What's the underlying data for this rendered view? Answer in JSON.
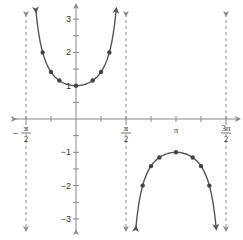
{
  "chart_data": {
    "type": "line",
    "title": "",
    "xlabel": "",
    "ylabel": "",
    "function": "y = sec x",
    "xlim": [
      -1.5708,
      4.7124
    ],
    "ylim": [
      -3.2,
      3.4
    ],
    "grid": false,
    "legend": null,
    "x_ticks": [
      {
        "value": -1.5708,
        "label_num": "π",
        "label_den": "2",
        "sign": "−"
      },
      {
        "value": -0.7854,
        "label_num": "",
        "label_den": "",
        "sign": ""
      },
      {
        "value": 0.7854,
        "label_num": "",
        "label_den": "",
        "sign": ""
      },
      {
        "value": 1.5708,
        "label_num": "π",
        "label_den": "2",
        "sign": ""
      },
      {
        "value": 2.3562,
        "label_num": "",
        "label_den": "",
        "sign": ""
      },
      {
        "value": 3.1416,
        "label_num": "π",
        "label_den": "",
        "sign": ""
      },
      {
        "value": 3.927,
        "label_num": "",
        "label_den": "",
        "sign": ""
      },
      {
        "value": 4.7124,
        "label_num": "3π",
        "label_den": "2",
        "sign": ""
      }
    ],
    "y_ticks": [
      {
        "value": 3,
        "label": "3"
      },
      {
        "value": 2.5,
        "label": ""
      },
      {
        "value": 2,
        "label": "2"
      },
      {
        "value": 1.5,
        "label": ""
      },
      {
        "value": 1,
        "label": "1"
      },
      {
        "value": 0.5,
        "label": ""
      },
      {
        "value": -0.5,
        "label": ""
      },
      {
        "value": -1,
        "label": "−1"
      },
      {
        "value": -1.5,
        "label": ""
      },
      {
        "value": -2,
        "label": "−2"
      },
      {
        "value": -2.5,
        "label": ""
      },
      {
        "value": -3,
        "label": "−3"
      }
    ],
    "asymptotes": [
      -1.5708,
      1.5708,
      4.7124
    ],
    "series": [
      {
        "name": "branch-1",
        "domain": [
          -1.26,
          1.26
        ],
        "points": [
          {
            "x": -1.0472,
            "y": 2.0
          },
          {
            "x": -0.7854,
            "y": 1.414
          },
          {
            "x": -0.5236,
            "y": 1.155
          },
          {
            "x": 0,
            "y": 1.0
          },
          {
            "x": 0.5236,
            "y": 1.155
          },
          {
            "x": 0.7854,
            "y": 1.414
          },
          {
            "x": 1.0472,
            "y": 2.0
          }
        ]
      },
      {
        "name": "branch-2",
        "domain": [
          1.88,
          4.4
        ],
        "points": [
          {
            "x": 2.0944,
            "y": -2.0
          },
          {
            "x": 2.3562,
            "y": -1.414
          },
          {
            "x": 2.618,
            "y": -1.155
          },
          {
            "x": 3.1416,
            "y": -1.0
          },
          {
            "x": 3.6652,
            "y": -1.155
          },
          {
            "x": 3.927,
            "y": -1.414
          },
          {
            "x": 4.1888,
            "y": -2.0
          }
        ]
      }
    ]
  },
  "style": {
    "axis_color": "#8a8a8a",
    "curve_color": "#555555",
    "point_color": "#444444",
    "asymptote_color": "#8a8a8a"
  },
  "layout": {
    "origin_px": [
      76,
      119
    ],
    "px_per_x_unit": 31.83,
    "px_per_y_unit": 33.3
  }
}
